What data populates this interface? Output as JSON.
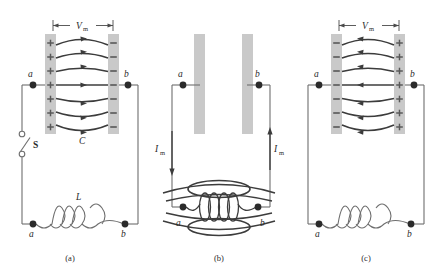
{
  "figure": {
    "colors": {
      "plate_fill": "#c9c9c9",
      "charge_symbol": "#585858",
      "field_line": "#3c3c3c",
      "wire": "#6e6e6e",
      "node_dot": "#2b2b2b",
      "text": "#2a2a2a",
      "background": "#ffffff"
    },
    "panels": [
      {
        "caption": "(a)",
        "voltage_label": "V",
        "voltage_subscript": "m",
        "left_plate_charge": "+",
        "right_plate_charge": "−",
        "charge_count": 7,
        "field_line_count": 7,
        "field_direction": "right",
        "capacitor_label": "C",
        "inductor_label": "L",
        "switch_label": "S",
        "switch_state": "open",
        "top_node_left": "a",
        "top_node_right": "b",
        "bottom_node_left": "a",
        "bottom_node_right": "b",
        "coil_turns": 3,
        "current_label": "",
        "current_subscript": ""
      },
      {
        "caption": "(b)",
        "voltage_label": "",
        "voltage_subscript": "",
        "left_plate_charge": "",
        "right_plate_charge": "",
        "charge_count": 0,
        "field_line_count": 0,
        "field_direction": "none",
        "capacitor_label": "",
        "inductor_label": "",
        "switch_label": "",
        "switch_state": "closed",
        "top_node_left": "a",
        "top_node_right": "b",
        "bottom_node_left": "a",
        "bottom_node_right": "b",
        "coil_turns": 4,
        "current_label": "I",
        "current_subscript": "m",
        "current_left_direction": "down",
        "current_right_direction": "up"
      },
      {
        "caption": "(c)",
        "voltage_label": "V",
        "voltage_subscript": "m",
        "left_plate_charge": "−",
        "right_plate_charge": "+",
        "charge_count": 7,
        "field_line_count": 7,
        "field_direction": "left",
        "capacitor_label": "",
        "inductor_label": "",
        "switch_label": "",
        "switch_state": "closed",
        "top_node_left": "a",
        "top_node_right": "b",
        "bottom_node_left": "a",
        "bottom_node_right": "b",
        "coil_turns": 3,
        "current_label": "",
        "current_subscript": ""
      }
    ]
  }
}
